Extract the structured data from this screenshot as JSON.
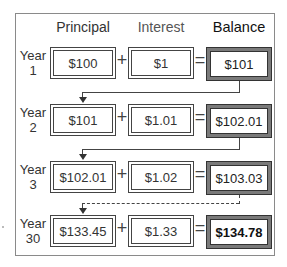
{
  "headers": {
    "principal": "Principal",
    "interest": "Interest",
    "balance": "Balance"
  },
  "rows": [
    {
      "year_label": "Year",
      "year_num": "1",
      "principal": "$100",
      "interest": "$1",
      "balance": "$101"
    },
    {
      "year_label": "Year",
      "year_num": "2",
      "principal": "$101",
      "interest": "$1.01",
      "balance": "$102.01"
    },
    {
      "year_label": "Year",
      "year_num": "3",
      "principal": "$102.01",
      "interest": "$1.02",
      "balance": "$103.03"
    },
    {
      "year_label": "Year",
      "year_num": "30",
      "principal": "$133.45",
      "interest": "$1.33",
      "balance": "$134.78"
    }
  ],
  "operators": {
    "plus": "+",
    "equals": "="
  },
  "colors": {
    "frame": "#8a8a8a",
    "balance_frame": "#7a7a7a",
    "text": "#333333"
  }
}
